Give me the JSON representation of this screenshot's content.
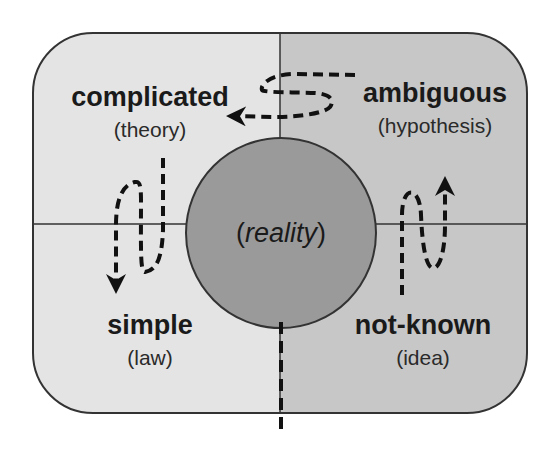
{
  "diagram": {
    "type": "quadrant-diagram",
    "center": {
      "open": "(",
      "word": "reality",
      "close": ")"
    },
    "quadrants": [
      {
        "position": "top-left",
        "title": "complicated",
        "subtitle": "(theory)"
      },
      {
        "position": "top-right",
        "title": "ambiguous",
        "subtitle": "(hypothesis)"
      },
      {
        "position": "bottom-left",
        "title": "simple",
        "subtitle": "(law)"
      },
      {
        "position": "bottom-right",
        "title": "not-known",
        "subtitle": "(idea)"
      }
    ],
    "flows": [
      {
        "from": "not-known",
        "to": "ambiguous",
        "style": "dashed-arrow"
      },
      {
        "from": "ambiguous",
        "to": "complicated",
        "style": "dashed-arrow"
      },
      {
        "from": "complicated",
        "to": "simple",
        "style": "dashed-arrow"
      }
    ],
    "colors": {
      "left_fill": "#e4e4e4",
      "right_fill": "#c7c7c7",
      "circle_fill": "#9a9a9a",
      "stroke": "#333333",
      "text": "#1a1a1a"
    }
  }
}
